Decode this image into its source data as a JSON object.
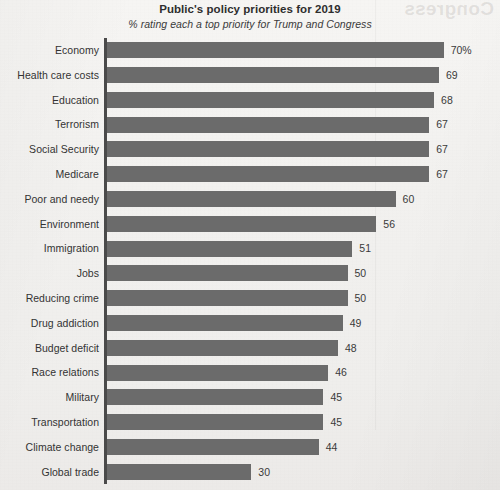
{
  "header": {
    "title": "Public's policy priorities for 2019",
    "subtitle": "% rating each a top priority for Trump and Congress"
  },
  "artifacts": {
    "bleed_through_text": "Congress"
  },
  "colors": {
    "bar": "#6b6b6b",
    "axis": "#4a4a4a",
    "label_text": "#333333",
    "value_text": "#3a3a3a",
    "title_text": "#2e2e2e",
    "page_background": "#f2f1ef"
  },
  "chart_data": {
    "type": "bar",
    "orientation": "horizontal",
    "title": "Public's policy priorities for 2019",
    "subtitle": "% rating each a top priority for Trump and Congress",
    "xlabel": "",
    "ylabel": "",
    "xlim": [
      0,
      70
    ],
    "grid": false,
    "legend": false,
    "sorted": "descending",
    "value_suffix_first_row": "%",
    "categories": [
      "Economy",
      "Health care costs",
      "Education",
      "Terrorism",
      "Social Security",
      "Medicare",
      "Poor and needy",
      "Environment",
      "Immigration",
      "Jobs",
      "Reducing crime",
      "Drug addiction",
      "Budget deficit",
      "Race relations",
      "Military",
      "Transportation",
      "Climate change",
      "Global trade"
    ],
    "values": [
      70,
      69,
      68,
      67,
      67,
      67,
      60,
      56,
      51,
      50,
      50,
      49,
      48,
      46,
      45,
      45,
      44,
      30
    ],
    "value_labels": [
      "70%",
      "69",
      "68",
      "67",
      "67",
      "67",
      "60",
      "56",
      "51",
      "50",
      "50",
      "49",
      "48",
      "46",
      "45",
      "45",
      "44",
      "30"
    ]
  }
}
